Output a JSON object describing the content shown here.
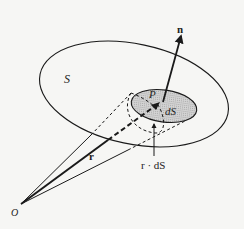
{
  "figure": {
    "labels": {
      "surface": "S",
      "point_p": "P",
      "area_element": "dS",
      "normal": "n",
      "position_vector": "r",
      "origin": "O",
      "dot_product": "r · dS"
    },
    "colors": {
      "line": "#1a1a1a",
      "shaded_patch": "#c8c8c8",
      "background": "#f6f6f4"
    }
  }
}
